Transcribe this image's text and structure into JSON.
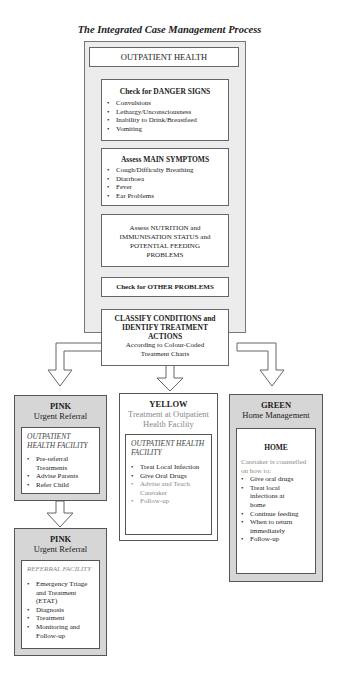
{
  "title": "The Integrated Case Management Process",
  "outpatient": {
    "header": "OUTPATIENT HEALTH",
    "danger_signs": {
      "heading": "Check for DANGER SIGNS",
      "items": [
        "Convulsions",
        "Lethargy/Unconsciousness",
        "Inability to Drink/Breastfeed",
        "Vomiting"
      ]
    },
    "main_symptoms": {
      "heading": "Assess MAIN SYMPTOMS",
      "items": [
        "Cough/Difficulty Breathing",
        "Diarrhoea",
        "Fever",
        "Ear Problems"
      ]
    },
    "nutrition": {
      "text": "Assess NUTRITION and IMMUNISATION STATUS and POTENTIAL FEEDING PROBLEMS"
    },
    "other_problems": {
      "text": "Check for OTHER PROBLEMS"
    },
    "classify": {
      "heading": "CLASSIFY CONDITIONS and IDENTIFY TREATMENT ACTIONS",
      "sub": "According to Colour-Coded Treatment Charts"
    }
  },
  "pink": {
    "name": "PINK",
    "label": "Urgent Referral",
    "facility": "OUTPATIENT HEALTH FACILITY",
    "items": [
      "Pre-referral Treatments",
      "Advise Parents",
      "Refer Child"
    ]
  },
  "yellow": {
    "name": "YELLOW",
    "label": "Treatment at Outpatient Health Facility",
    "facility": "OUTPATIENT HEALTH FACILITY",
    "items": [
      "Treat Local Infection",
      "Give Oral Drugs",
      "Advise and Teach Caretaker",
      "Follow-up"
    ]
  },
  "green": {
    "name": "GREEN",
    "label": "Home Management",
    "facility": "HOME",
    "intro": "Caretaker is counselled on how to:",
    "items": [
      "Give oral drugs",
      "Treat local infections at home",
      "Continue feeding",
      "When to return immediately",
      "Follow-up"
    ]
  },
  "pink_referral": {
    "name": "PINK",
    "label": "Urgent Referral",
    "facility": "REFERRAL FACILITY",
    "items": [
      "Emergency Triage and Treatment (ETAT)",
      "Diagnosis",
      "Treatment",
      "Monitoring and Follow-up"
    ]
  }
}
